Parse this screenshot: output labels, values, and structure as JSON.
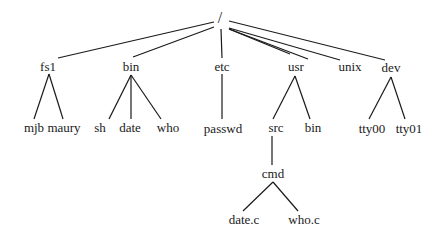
{
  "diagram": {
    "title": "",
    "type": "file-system-tree",
    "nodes": [
      {
        "id": "root",
        "label": "/",
        "x": 220,
        "y": 18,
        "parent": null
      },
      {
        "id": "fs1",
        "label": "fs1",
        "x": 48,
        "y": 66,
        "parent": "root"
      },
      {
        "id": "bin",
        "label": "bin",
        "x": 131,
        "y": 66,
        "parent": "root"
      },
      {
        "id": "etc",
        "label": "etc",
        "x": 222,
        "y": 66,
        "parent": "root"
      },
      {
        "id": "usr",
        "label": "usr",
        "x": 296,
        "y": 66,
        "parent": "root"
      },
      {
        "id": "unix",
        "label": "unix",
        "x": 350,
        "y": 66,
        "parent": "root"
      },
      {
        "id": "dev",
        "label": "dev",
        "x": 391,
        "y": 67,
        "parent": "root"
      },
      {
        "id": "mjb",
        "label": "mjb",
        "x": 34,
        "y": 127,
        "parent": "fs1"
      },
      {
        "id": "maury",
        "label": "maury",
        "x": 64,
        "y": 127,
        "parent": "fs1"
      },
      {
        "id": "sh",
        "label": "sh",
        "x": 100,
        "y": 127,
        "parent": "bin"
      },
      {
        "id": "date",
        "label": "date",
        "x": 130,
        "y": 127,
        "parent": "bin"
      },
      {
        "id": "who",
        "label": "who",
        "x": 168,
        "y": 127,
        "parent": "bin"
      },
      {
        "id": "passwd",
        "label": "passwd",
        "x": 223,
        "y": 128,
        "parent": "etc"
      },
      {
        "id": "src",
        "label": "src",
        "x": 276,
        "y": 127,
        "parent": "usr"
      },
      {
        "id": "usrbin",
        "label": "bin",
        "x": 313,
        "y": 127,
        "parent": "usr"
      },
      {
        "id": "tty00",
        "label": "tty00",
        "x": 372,
        "y": 128,
        "parent": "dev"
      },
      {
        "id": "tty01",
        "label": "tty01",
        "x": 409,
        "y": 128,
        "parent": "dev"
      },
      {
        "id": "cmd",
        "label": "cmd",
        "x": 273,
        "y": 173,
        "parent": "src"
      },
      {
        "id": "datec",
        "label": "date.c",
        "x": 244,
        "y": 219,
        "parent": "cmd"
      },
      {
        "id": "whoc",
        "label": "who.c",
        "x": 304,
        "y": 219,
        "parent": "cmd"
      }
    ],
    "edges": [
      {
        "from": [
          214,
          22
        ],
        "to": [
          58,
          58
        ]
      },
      {
        "from": [
          214,
          27
        ],
        "to": [
          133,
          57
        ]
      },
      {
        "from": [
          221,
          29
        ],
        "to": [
          222,
          58
        ]
      },
      {
        "from": [
          229,
          29
        ],
        "to": [
          308,
          59
        ]
      },
      {
        "from": [
          229,
          29
        ],
        "to": [
          290,
          54
        ]
      },
      {
        "from": [
          229,
          28
        ],
        "to": [
          340,
          60
        ]
      },
      {
        "from": [
          229,
          21
        ],
        "to": [
          385,
          60
        ]
      },
      {
        "from": [
          49,
          74
        ],
        "to": [
          34,
          119
        ]
      },
      {
        "from": [
          49,
          74
        ],
        "to": [
          63,
          119
        ]
      },
      {
        "from": [
          131,
          75
        ],
        "to": [
          109,
          119
        ]
      },
      {
        "from": [
          131,
          75
        ],
        "to": [
          131,
          119
        ]
      },
      {
        "from": [
          131,
          75
        ],
        "to": [
          161,
          119
        ]
      },
      {
        "from": [
          222,
          74
        ],
        "to": [
          222,
          119
        ]
      },
      {
        "from": [
          295,
          76
        ],
        "to": [
          273,
          119
        ]
      },
      {
        "from": [
          295,
          76
        ],
        "to": [
          310,
          119
        ]
      },
      {
        "from": [
          391,
          77
        ],
        "to": [
          369,
          119
        ]
      },
      {
        "from": [
          391,
          77
        ],
        "to": [
          405,
          119
        ]
      },
      {
        "from": [
          272,
          136
        ],
        "to": [
          272,
          165
        ]
      },
      {
        "from": [
          273,
          182
        ],
        "to": [
          243,
          211
        ]
      },
      {
        "from": [
          273,
          182
        ],
        "to": [
          298,
          211
        ]
      }
    ]
  }
}
